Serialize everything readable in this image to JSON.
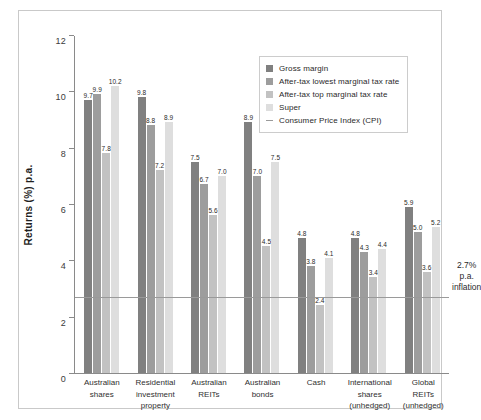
{
  "chart_data": {
    "type": "bar",
    "title": "",
    "xlabel": "",
    "ylabel": "Returns (%) p.a.",
    "ylim": [
      0,
      12
    ],
    "yticks": [
      0,
      2,
      4,
      6,
      8,
      10,
      12
    ],
    "grid": false,
    "legend_position": "top-right",
    "categories": [
      "Australian shares",
      "Residential investment property",
      "Australian REITs",
      "Australian bonds",
      "Cash",
      "International shares (unhedged)",
      "Global REITs (unhedged)"
    ],
    "category_lines": [
      [
        "Australian",
        "shares"
      ],
      [
        "Residential",
        "investment",
        "property"
      ],
      [
        "Australian",
        "REITs"
      ],
      [
        "Australian",
        "bonds"
      ],
      [
        "Cash"
      ],
      [
        "International",
        "shares",
        "(unhedged)"
      ],
      [
        "Global",
        "REITs",
        "(unhedged)"
      ]
    ],
    "series": [
      {
        "name": "Gross margin",
        "color": "#808080",
        "values": [
          9.7,
          9.8,
          7.5,
          8.9,
          4.8,
          4.8,
          5.9
        ]
      },
      {
        "name": "After-tax lowest marginal tax rate",
        "color": "#9d9d9d",
        "values": [
          9.9,
          8.8,
          6.7,
          7.0,
          3.8,
          4.3,
          5.0
        ]
      },
      {
        "name": "After-tax top marginal tax rate",
        "color": "#c2c2c2",
        "values": [
          7.8,
          7.2,
          5.6,
          4.5,
          2.4,
          3.4,
          3.6
        ]
      },
      {
        "name": "Super",
        "color": "#dedede",
        "values": [
          10.2,
          8.9,
          7.0,
          7.5,
          4.1,
          4.4,
          5.2
        ]
      }
    ],
    "reference_line": {
      "label": "Consumer Price Index (CPI)",
      "value": 2.7,
      "color": "#9a9a9a",
      "annotation_lines": [
        "2.7%",
        "p.a.",
        "inflation"
      ]
    }
  },
  "legend": {
    "entries": [
      {
        "label": "Gross margin",
        "type": "swatch"
      },
      {
        "label": "After-tax lowest marginal tax rate",
        "type": "swatch"
      },
      {
        "label": "After-tax top marginal tax rate",
        "type": "swatch"
      },
      {
        "label": "Super",
        "type": "swatch"
      },
      {
        "label": "Consumer Price Index (CPI)",
        "type": "line"
      }
    ]
  }
}
